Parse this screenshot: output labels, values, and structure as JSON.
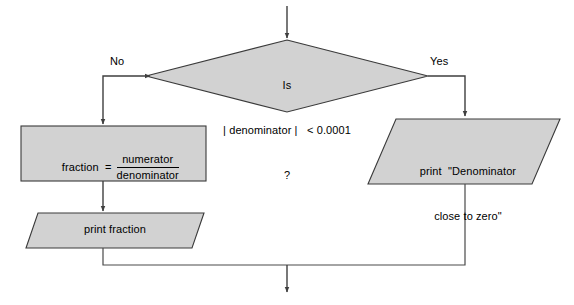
{
  "diagram": {
    "fill_color": "#d2d2d2",
    "line_color": "#3f3f3f",
    "background_color": "#ffffff"
  },
  "nodes": {
    "entry_arrow": {
      "name": "entry-arrow"
    },
    "decision": {
      "shape": "diamond",
      "line1": "Is",
      "line2": "| denominator |   < 0.0001",
      "line3": "?"
    },
    "assignment": {
      "shape": "rectangle",
      "lhs": "fraction  =",
      "numerator": "numerator",
      "denominator": "denominator"
    },
    "print_fraction": {
      "shape": "parallelogram",
      "text": "print fraction"
    },
    "print_denominator_warning": {
      "shape": "parallelogram",
      "line1": "print  \"Denominator",
      "line2": "close to zero\""
    }
  },
  "edges": {
    "no_branch_label": "No",
    "yes_branch_label": "Yes"
  }
}
